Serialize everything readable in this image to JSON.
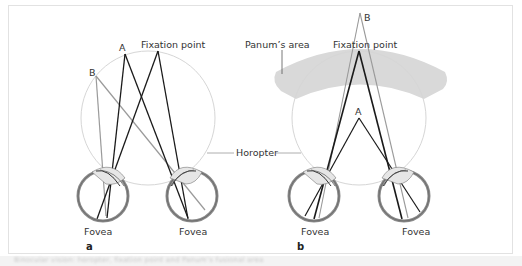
{
  "figure": {
    "panel_a": {
      "panel_label": "a",
      "labels": {
        "fixation_point": "Fixation point",
        "point_a": "A",
        "point_b": "B",
        "fovea_left": "Fovea",
        "fovea_right": "Fovea"
      }
    },
    "panel_b": {
      "panel_label": "b",
      "labels": {
        "panums_area": "Panum’s area",
        "fixation_point": "Fixation point",
        "point_a": "A",
        "point_b": "B",
        "fovea_left": "Fovea",
        "fovea_right": "Fovea"
      }
    },
    "shared_labels": {
      "horopter": "Horopter"
    },
    "caption": "Binocular vision: horopter, fixation point and Panum’s fusional area"
  },
  "colors": {
    "frame_border": "#e2e2e2",
    "horopter_circle": "#d6d6d6",
    "panums_area_fill": "#d9d9d9",
    "ray_dark": "#1a1a1a",
    "ray_gray": "#9a9a9a",
    "eye_ring": "#8a8a8a",
    "caption_strip": "#f3f3f3"
  }
}
